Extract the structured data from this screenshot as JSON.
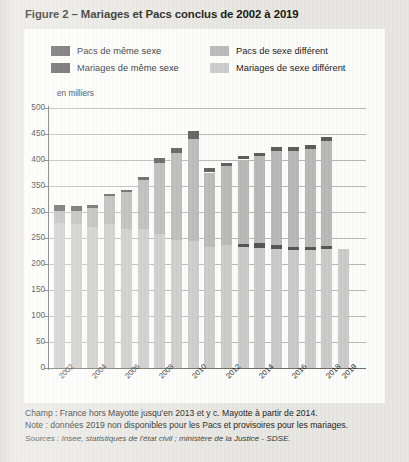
{
  "title": "Figure 2 – Mariages et Pacs conclus de 2002 à 2019",
  "axis_caption": "en milliers",
  "legend": {
    "left": [
      {
        "label": "Pacs de même sexe",
        "color": "#5c5c5c"
      },
      {
        "label": "Mariages de même sexe",
        "color": "#555555"
      }
    ],
    "right": [
      {
        "label": "Pacs de sexe différent",
        "color": "#b9b9b9"
      },
      {
        "label": "Mariages de sexe différent",
        "color": "#cbcbcb"
      }
    ]
  },
  "notes": {
    "champ": "Champ : France hors Mayotte jusqu'en 2013 et y c. Mayotte à partir de 2014.",
    "note": "Note : données 2019 non disponibles pour les Pacs et provisoires pour les mariages.",
    "sources": "Sources : Insee, statistiques de l'état civil ; ministère de la Justice - SDSE."
  },
  "chart_data": {
    "type": "bar",
    "stacked": true,
    "title": "Mariages et Pacs conclus de 2002 à 2019",
    "xlabel": "",
    "ylabel": "en milliers",
    "ylim": [
      0,
      500
    ],
    "ytick_step": 50,
    "yticks": [
      0,
      50,
      100,
      150,
      200,
      250,
      300,
      350,
      400,
      450,
      500
    ],
    "grid": true,
    "legend_position": "top",
    "categories": [
      "2002",
      "2003",
      "2004",
      "2005",
      "2006",
      "2007",
      "2008",
      "2009",
      "2010",
      "2011",
      "2012",
      "2013",
      "2014",
      "2015",
      "2016",
      "2017",
      "2018",
      "2019"
    ],
    "tick_labels_shown": [
      "2002",
      "2004",
      "2006",
      "2008",
      "2010",
      "2012",
      "2014",
      "2016",
      "2018",
      "2019"
    ],
    "series": [
      {
        "name": "Mariages de sexe différent",
        "color": "#cbcbcb",
        "values": [
          279,
          276,
          271,
          276,
          267,
          267,
          258,
          246,
          245,
          232,
          236,
          232,
          231,
          229,
          226,
          226,
          228,
          228
        ]
      },
      {
        "name": "Mariages de même sexe",
        "color": "#555555",
        "values": [
          0,
          0,
          0,
          0,
          0,
          0,
          0,
          0,
          0,
          0,
          0,
          7,
          10,
          8,
          7,
          7,
          6,
          0
        ]
      },
      {
        "name": "Pacs de sexe différent",
        "color": "#b9b9b9",
        "values": [
          23,
          26,
          37,
          54,
          71,
          95,
          137,
          168,
          196,
          144,
          152,
          162,
          167,
          181,
          185,
          188,
          202,
          0
        ]
      },
      {
        "name": "Pacs de même sexe",
        "color": "#5c5c5c",
        "values": [
          11,
          9,
          6,
          5,
          5,
          6,
          9,
          10,
          15,
          8,
          7,
          6,
          6,
          7,
          7,
          8,
          9,
          0
        ]
      }
    ],
    "totals": [
      313,
      311,
      314,
      335,
      343,
      368,
      404,
      424,
      456,
      384,
      395,
      407,
      414,
      425,
      425,
      429,
      445,
      228
    ]
  }
}
